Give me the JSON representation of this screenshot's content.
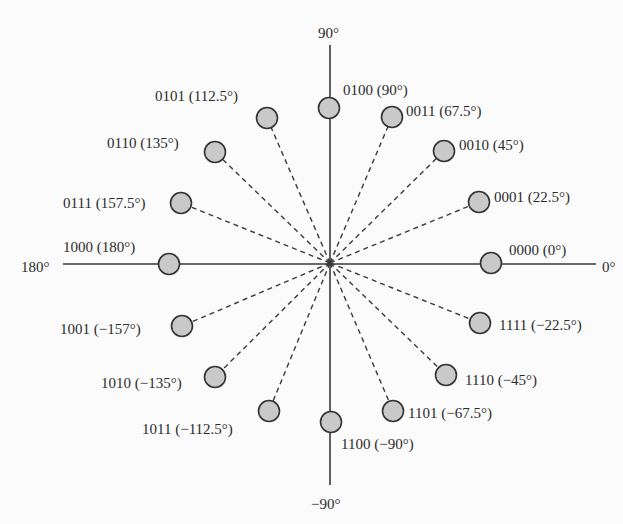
{
  "diagram": {
    "type": "constellation",
    "center": [
      330,
      263
    ],
    "colors": {
      "background": "#fbfbfb",
      "axis": "#3a3a3a",
      "dashed_line": "#3a3a3a",
      "point_fill": "#c9c9c9",
      "point_stroke": "#333333",
      "text": "#2b2b2b"
    },
    "axes": {
      "x_axis": {
        "x1": 63,
        "x2": 596,
        "y": 264
      },
      "y_axis": {
        "x": 330,
        "y1": 45,
        "y2": 485
      },
      "labels": [
        {
          "id": "90",
          "text": "90°",
          "x": 318,
          "y": 38
        },
        {
          "id": "minus90",
          "text": "−90°",
          "x": 311,
          "y": 509
        },
        {
          "id": "180",
          "text": "180°",
          "x": 21,
          "y": 272
        },
        {
          "id": "0",
          "text": "0°",
          "x": 602,
          "y": 272
        }
      ]
    },
    "points": [
      {
        "bits": "0000",
        "phase": "0°",
        "label": "0000 (0°)",
        "cx": 491,
        "cy": 263,
        "lx": 509,
        "ly": 255,
        "dashed": false
      },
      {
        "bits": "0001",
        "phase": "22.5°",
        "label": "0001 (22.5°)",
        "cx": 479,
        "cy": 202,
        "lx": 494,
        "ly": 202,
        "dashed": true
      },
      {
        "bits": "0010",
        "phase": "45°",
        "label": "0010 (45°)",
        "cx": 444,
        "cy": 151,
        "lx": 459,
        "ly": 150,
        "dashed": true
      },
      {
        "bits": "0011",
        "phase": "67.5°",
        "label": "0011 (67.5°)",
        "cx": 392,
        "cy": 117,
        "lx": 406,
        "ly": 116,
        "dashed": true
      },
      {
        "bits": "0100",
        "phase": "90°",
        "label": "0100 (90°)",
        "cx": 329,
        "cy": 108,
        "lx": 343,
        "ly": 95,
        "dashed": false
      },
      {
        "bits": "0101",
        "phase": "112.5°",
        "label": "0101 (112.5°)",
        "cx": 267,
        "cy": 118,
        "lx": 155,
        "ly": 101,
        "dashed": true
      },
      {
        "bits": "0110",
        "phase": "135°",
        "label": "0110 (135°)",
        "cx": 215,
        "cy": 152,
        "lx": 107,
        "ly": 148,
        "dashed": true
      },
      {
        "bits": "0111",
        "phase": "157.5°",
        "label": "0111 (157.5°)",
        "cx": 181,
        "cy": 203,
        "lx": 63,
        "ly": 208,
        "dashed": true
      },
      {
        "bits": "1000",
        "phase": "180°",
        "label": "1000 (180°)",
        "cx": 169,
        "cy": 264,
        "lx": 63,
        "ly": 252,
        "dashed": false
      },
      {
        "bits": "1001",
        "phase": "−157°",
        "label": "1001 (−157°)",
        "cx": 182,
        "cy": 326,
        "lx": 60,
        "ly": 334,
        "dashed": true
      },
      {
        "bits": "1010",
        "phase": "−135°",
        "label": "1010 (−135°)",
        "cx": 215,
        "cy": 377,
        "lx": 101,
        "ly": 388,
        "dashed": true
      },
      {
        "bits": "1011",
        "phase": "−112.5°",
        "label": "1011 (−112.5°)",
        "cx": 269,
        "cy": 411,
        "lx": 142,
        "ly": 434,
        "dashed": true
      },
      {
        "bits": "1100",
        "phase": "−90°",
        "label": "1100 (−90°)",
        "cx": 331,
        "cy": 422,
        "lx": 341,
        "ly": 449,
        "dashed": false
      },
      {
        "bits": "1101",
        "phase": "−67.5°",
        "label": "1101 (−67.5°)",
        "cx": 393,
        "cy": 411,
        "lx": 408,
        "ly": 418,
        "dashed": true
      },
      {
        "bits": "1110",
        "phase": "−45°",
        "label": "1110 (−45°)",
        "cx": 446,
        "cy": 375,
        "lx": 465,
        "ly": 385,
        "dashed": true
      },
      {
        "bits": "1111",
        "phase": "−22.5°",
        "label": "1111 (−22.5°)",
        "cx": 480,
        "cy": 323,
        "lx": 499,
        "ly": 330,
        "dashed": true
      }
    ]
  }
}
